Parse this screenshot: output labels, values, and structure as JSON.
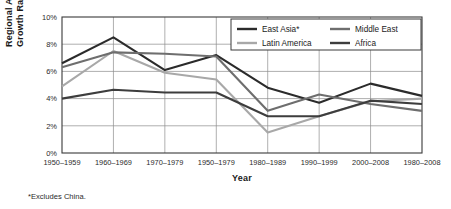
{
  "chart_data": {
    "type": "line",
    "title": "",
    "xlabel": "Year",
    "ylabel": "Regional Average GDP Growth Rates",
    "categories": [
      "1950–1959",
      "1960–1969",
      "1970–1979",
      "1950–1979",
      "1980–1989",
      "1990–1999",
      "2000–2008",
      "1980–2008"
    ],
    "ylim": [
      0,
      10
    ],
    "yticks": [
      0,
      2,
      4,
      6,
      8,
      10
    ],
    "ytick_labels": [
      "0%",
      "2%",
      "4%",
      "6%",
      "8%",
      "10%"
    ],
    "grid": true,
    "legend_position": "top-right-inside",
    "series": [
      {
        "name": "East Asia*",
        "color": "#2b2b2b",
        "values": [
          6.6,
          8.5,
          6.1,
          7.2,
          4.8,
          3.7,
          5.1,
          4.2
        ]
      },
      {
        "name": "Latin America",
        "color": "#a8a8a8",
        "values": [
          4.9,
          7.5,
          5.9,
          5.4,
          1.5,
          2.7,
          3.8,
          4.0
        ]
      },
      {
        "name": "Middle East",
        "color": "#6e6e6e",
        "values": [
          6.3,
          7.4,
          7.3,
          7.1,
          3.1,
          4.3,
          3.6,
          3.1
        ]
      },
      {
        "name": "Africa",
        "color": "#3d3d3d",
        "values": [
          4.0,
          4.65,
          4.45,
          4.45,
          2.7,
          2.7,
          3.85,
          3.6
        ]
      }
    ],
    "footnote": "*Excludes China."
  }
}
